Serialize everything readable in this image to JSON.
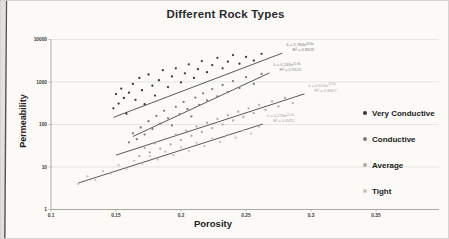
{
  "chart_data": {
    "type": "scatter",
    "title": "Different Rock Types",
    "xlabel": "Porosity",
    "ylabel": "Permeability",
    "y_scale": "log",
    "xlim": [
      0.1,
      0.4
    ],
    "ylim": [
      1,
      10000
    ],
    "x_ticks": [
      "0.1",
      "0.15",
      "0.2",
      "0.25",
      "0.3",
      "0.35"
    ],
    "y_ticks": [
      "1",
      "10",
      "100",
      "1000",
      "10000"
    ],
    "grid": "horizontal decade gridlines",
    "legend_position": "right",
    "series": [
      {
        "name": "Very Conductive",
        "color": "#35363f",
        "ann_color": "#77777c",
        "points": [
          [
            0.148,
            240
          ],
          [
            0.15,
            520
          ],
          [
            0.152,
            310
          ],
          [
            0.154,
            700
          ],
          [
            0.156,
            420
          ],
          [
            0.158,
            180
          ],
          [
            0.16,
            560
          ],
          [
            0.163,
            900
          ],
          [
            0.165,
            380
          ],
          [
            0.168,
            1250
          ],
          [
            0.17,
            640
          ],
          [
            0.172,
            300
          ],
          [
            0.175,
            1500
          ],
          [
            0.178,
            820
          ],
          [
            0.18,
            480
          ],
          [
            0.183,
            1100
          ],
          [
            0.186,
            1900
          ],
          [
            0.19,
            760
          ],
          [
            0.193,
            1350
          ],
          [
            0.196,
            2100
          ],
          [
            0.2,
            980
          ],
          [
            0.203,
            1600
          ],
          [
            0.206,
            2600
          ],
          [
            0.21,
            1250
          ],
          [
            0.213,
            2000
          ],
          [
            0.216,
            3100
          ],
          [
            0.22,
            1700
          ],
          [
            0.224,
            2500
          ],
          [
            0.228,
            3700
          ],
          [
            0.232,
            2100
          ],
          [
            0.236,
            3000
          ],
          [
            0.24,
            4300
          ],
          [
            0.245,
            2700
          ],
          [
            0.25,
            3900
          ],
          [
            0.256,
            3200
          ],
          [
            0.262,
            4600
          ]
        ],
        "trendline": {
          "a": 2.784,
          "b": 26.8,
          "x_start": 0.148,
          "x_end": 0.278,
          "eq_base": "k = 2.784e",
          "eq_exp": "26.8x",
          "r2": "R² = 0.8625"
        }
      },
      {
        "name": "Conductive",
        "color": "#7b7c80",
        "ann_color": "#8a8a8e",
        "points": [
          [
            0.16,
            38
          ],
          [
            0.163,
            62
          ],
          [
            0.166,
            45
          ],
          [
            0.169,
            85
          ],
          [
            0.172,
            58
          ],
          [
            0.175,
            120
          ],
          [
            0.178,
            78
          ],
          [
            0.181,
            160
          ],
          [
            0.184,
            105
          ],
          [
            0.187,
            210
          ],
          [
            0.19,
            140
          ],
          [
            0.193,
            95
          ],
          [
            0.196,
            260
          ],
          [
            0.199,
            175
          ],
          [
            0.202,
            340
          ],
          [
            0.205,
            230
          ],
          [
            0.208,
            155
          ],
          [
            0.211,
            430
          ],
          [
            0.214,
            290
          ],
          [
            0.217,
            540
          ],
          [
            0.22,
            370
          ],
          [
            0.224,
            680
          ],
          [
            0.228,
            460
          ],
          [
            0.232,
            850
          ],
          [
            0.236,
            580
          ],
          [
            0.24,
            1050
          ],
          [
            0.245,
            720
          ],
          [
            0.25,
            1300
          ],
          [
            0.256,
            900
          ],
          [
            0.262,
            1550
          ]
        ],
        "trendline": {
          "a": 0.249,
          "b": 32.8,
          "x_start": 0.163,
          "x_end": 0.268,
          "eq_base": "k = 0.249e",
          "eq_exp": "32.8x",
          "r2": "R² = 0.9121"
        }
      },
      {
        "name": "Average",
        "color": "#b0aca2",
        "ann_color": "#a9a7a0",
        "points": [
          [
            0.168,
            18
          ],
          [
            0.172,
            28
          ],
          [
            0.176,
            22
          ],
          [
            0.18,
            36
          ],
          [
            0.184,
            27
          ],
          [
            0.188,
            46
          ],
          [
            0.192,
            34
          ],
          [
            0.196,
            58
          ],
          [
            0.2,
            43
          ],
          [
            0.204,
            72
          ],
          [
            0.208,
            54
          ],
          [
            0.212,
            90
          ],
          [
            0.216,
            67
          ],
          [
            0.22,
            110
          ],
          [
            0.224,
            82
          ],
          [
            0.228,
            135
          ],
          [
            0.232,
            100
          ],
          [
            0.236,
            165
          ],
          [
            0.24,
            125
          ],
          [
            0.244,
            200
          ],
          [
            0.248,
            150
          ],
          [
            0.252,
            240
          ],
          [
            0.256,
            185
          ],
          [
            0.26,
            290
          ],
          [
            0.265,
            220
          ],
          [
            0.27,
            350
          ],
          [
            0.275,
            265
          ],
          [
            0.28,
            420
          ],
          [
            0.286,
            320
          ]
        ],
        "trendline": {
          "a": 0.613,
          "b": 22.9,
          "x_start": 0.15,
          "x_end": 0.295,
          "eq_base": "k = 0.613e",
          "eq_exp": "22.9x",
          "r2": "R² = 0.8667"
        }
      },
      {
        "name": "Tight",
        "color": "#c7c3b8",
        "ann_color": "#a9a7a0",
        "points": [
          [
            0.121,
            4
          ],
          [
            0.128,
            6
          ],
          [
            0.134,
            5
          ],
          [
            0.14,
            8
          ],
          [
            0.146,
            7
          ],
          [
            0.152,
            11
          ],
          [
            0.158,
            9
          ],
          [
            0.164,
            14
          ],
          [
            0.17,
            12
          ],
          [
            0.176,
            18
          ],
          [
            0.182,
            15
          ],
          [
            0.188,
            23
          ],
          [
            0.194,
            19
          ],
          [
            0.2,
            29
          ],
          [
            0.206,
            24
          ],
          [
            0.212,
            37
          ],
          [
            0.218,
            31
          ],
          [
            0.224,
            47
          ],
          [
            0.23,
            39
          ],
          [
            0.236,
            58
          ],
          [
            0.242,
            49
          ],
          [
            0.248,
            72
          ],
          [
            0.254,
            61
          ],
          [
            0.26,
            88
          ]
        ],
        "trendline": {
          "a": 0.276,
          "b": 22.5,
          "x_start": 0.121,
          "x_end": 0.263,
          "eq_base": "k = 0.276e",
          "eq_exp": "22.5x",
          "r2": "R² = 0.8451"
        }
      }
    ]
  }
}
